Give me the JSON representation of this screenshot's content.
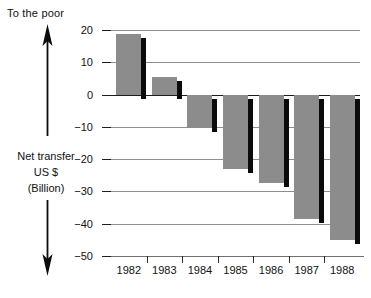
{
  "chart_data": {
    "type": "bar",
    "title": "",
    "subtitle": "",
    "xlabel": "",
    "ylabel": "Net transfer US $ (Billion)",
    "ylabel_lines": [
      "Net transfer",
      "US $",
      "(Billion)"
    ],
    "categories": [
      "1982",
      "1983",
      "1984",
      "1985",
      "1986",
      "1987",
      "1988"
    ],
    "values": [
      18.7,
      5.5,
      -10.5,
      -23.0,
      -27.5,
      -38.5,
      -45.0
    ],
    "ylim": [
      -50,
      20
    ],
    "yticks": [
      20,
      10,
      0,
      -10,
      -20,
      -30,
      -40,
      -50
    ],
    "ytick_labels": [
      "20",
      "10",
      "0",
      "−10",
      "−20",
      "−30",
      "−40",
      "−50"
    ],
    "grid": true,
    "legend": "none",
    "annotations": [
      {
        "text": "To the poor",
        "position": "top-left",
        "direction": "up"
      },
      {
        "text": "To the rich",
        "position": "bottom-left",
        "direction": "down"
      }
    ],
    "colors": {
      "bar_fill": "#8c8c8c",
      "bar_shadow": "#0b0b0b",
      "gridline": "#8e8e8e",
      "axis": "#1c1c1c",
      "text": "#111111",
      "background": "#ffffff"
    }
  },
  "annotations": {
    "top": "To the poor",
    "bottom": "To the rich"
  },
  "axis": {
    "title_line1": "Net transfer",
    "title_line2": "US $",
    "title_line3": "(Billion)"
  }
}
